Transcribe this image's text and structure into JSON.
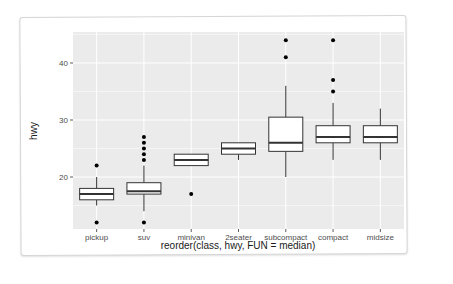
{
  "chart_data": {
    "type": "boxplot",
    "title": "",
    "xlabel": "reorder(class, hwy, FUN = median)",
    "ylabel": "hwy",
    "ylim": [
      10,
      46
    ],
    "yticks": [
      20,
      30,
      40
    ],
    "grid": true,
    "legend": "none",
    "categories": [
      "pickup",
      "suv",
      "minivan",
      "2seater",
      "subcompact",
      "compact",
      "midsize"
    ],
    "boxes": [
      {
        "name": "pickup",
        "whisker_low": 15,
        "q1": 16,
        "median": 17,
        "q3": 18,
        "whisker_high": 20,
        "outliers": [
          12,
          22
        ]
      },
      {
        "name": "suv",
        "whisker_low": 14,
        "q1": 17,
        "median": 17.5,
        "q3": 19,
        "whisker_high": 22,
        "outliers": [
          12,
          23,
          24,
          25,
          26,
          27
        ]
      },
      {
        "name": "minivan",
        "whisker_low": 22,
        "q1": 22,
        "median": 23,
        "q3": 24,
        "whisker_high": 24,
        "outliers": [
          17
        ]
      },
      {
        "name": "2seater",
        "whisker_low": 23,
        "q1": 24,
        "median": 25,
        "q3": 26,
        "whisker_high": 26,
        "outliers": []
      },
      {
        "name": "subcompact",
        "whisker_low": 20,
        "q1": 24.5,
        "median": 26,
        "q3": 30.5,
        "whisker_high": 36,
        "outliers": [
          41,
          44
        ]
      },
      {
        "name": "compact",
        "whisker_low": 23,
        "q1": 26,
        "median": 27,
        "q3": 29,
        "whisker_high": 33,
        "outliers": [
          35,
          37,
          44
        ]
      },
      {
        "name": "midsize",
        "whisker_low": 23,
        "q1": 26,
        "median": 27,
        "q3": 29,
        "whisker_high": 32,
        "outliers": []
      }
    ]
  },
  "colors": {
    "panel_bg": "#ebebeb",
    "grid": "#ffffff",
    "box_fill": "#ffffff",
    "box_stroke": "#333333",
    "outlier": "#000000"
  }
}
